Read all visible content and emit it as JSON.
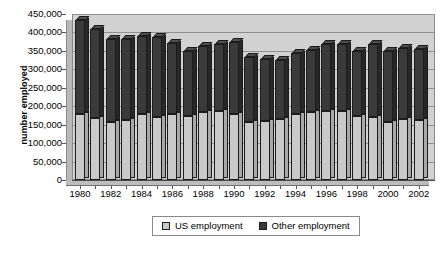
{
  "chart_data": {
    "type": "bar",
    "title": "",
    "xlabel": "",
    "ylabel": "number employed",
    "stacked": true,
    "grid": true,
    "legend_position": "bottom",
    "ylim": [
      0,
      450000
    ],
    "yticks": [
      "0",
      "50,000",
      "100,000",
      "150,000",
      "200,000",
      "250,000",
      "300,000",
      "350,000",
      "400,000",
      "450,000"
    ],
    "ytick_values": [
      0,
      50000,
      100000,
      150000,
      200000,
      250000,
      300000,
      350000,
      400000,
      450000
    ],
    "categories": [
      "1980",
      "1981",
      "1982",
      "1983",
      "1984",
      "1985",
      "1986",
      "1987",
      "1988",
      "1989",
      "1990",
      "1991",
      "1992",
      "1993",
      "1994",
      "1995",
      "1996",
      "1997",
      "1998",
      "1999",
      "2000",
      "2001",
      "2002"
    ],
    "xtick_labels": [
      "1980",
      "1982",
      "1984",
      "1986",
      "1988",
      "1990",
      "1992",
      "1994",
      "1996",
      "1998",
      "2000",
      "2002"
    ],
    "series": [
      {
        "name": "US employment",
        "color": "#c9c9c9",
        "values": [
          178000,
          168000,
          157000,
          162000,
          178000,
          171000,
          179000,
          173000,
          184000,
          188000,
          179000,
          158000,
          160000,
          165000,
          178000,
          184000,
          187000,
          187000,
          174000,
          170000,
          157000,
          166000,
          162000
        ]
      },
      {
        "name": "Other employment",
        "color": "#3a3a3a",
        "values": [
          257000,
          242000,
          225000,
          220000,
          213000,
          217000,
          192000,
          177000,
          179000,
          181000,
          196000,
          175000,
          168000,
          161000,
          165000,
          168000,
          183000,
          183000,
          177000,
          200000,
          192000,
          193000,
          192000
        ]
      }
    ],
    "totals": [
      435000,
      410000,
      382000,
      382000,
      391000,
      388000,
      371000,
      350000,
      363000,
      369000,
      375000,
      333000,
      328000,
      326000,
      343000,
      352000,
      370000,
      370000,
      351000,
      370000,
      349000,
      359000,
      354000
    ]
  },
  "legend": {
    "items": [
      {
        "label": "US employment",
        "swatch": "us"
      },
      {
        "label": "Other employment",
        "swatch": "other"
      }
    ]
  }
}
